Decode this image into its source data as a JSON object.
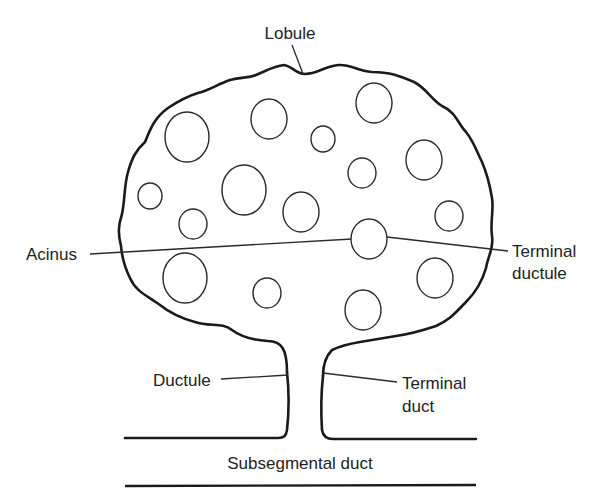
{
  "diagram": {
    "labels": {
      "lobule": "Lobule",
      "acinus": "Acinus",
      "terminal_ductule_line1": "Terminal",
      "terminal_ductule_line2": "ductule",
      "ductule": "Ductule",
      "terminal_duct_line1": "Terminal",
      "terminal_duct_line2": "duct",
      "subsegmental_duct": "Subsegmental duct"
    },
    "colors": {
      "stroke": "#1a1a1a",
      "text": "#222222",
      "background": "#ffffff"
    },
    "acini": [
      {
        "cx": 187,
        "cy": 137,
        "rx": 22,
        "ry": 25
      },
      {
        "cx": 269,
        "cy": 119,
        "rx": 18,
        "ry": 20
      },
      {
        "cx": 374,
        "cy": 103,
        "rx": 18,
        "ry": 20
      },
      {
        "cx": 323,
        "cy": 139,
        "rx": 12,
        "ry": 13
      },
      {
        "cx": 424,
        "cy": 160,
        "rx": 18,
        "ry": 20
      },
      {
        "cx": 362,
        "cy": 173,
        "rx": 14,
        "ry": 15
      },
      {
        "cx": 244,
        "cy": 190,
        "rx": 22,
        "ry": 25
      },
      {
        "cx": 150,
        "cy": 196,
        "rx": 12,
        "ry": 13
      },
      {
        "cx": 301,
        "cy": 212,
        "rx": 18,
        "ry": 20
      },
      {
        "cx": 193,
        "cy": 224,
        "rx": 14,
        "ry": 15
      },
      {
        "cx": 449,
        "cy": 216,
        "rx": 14,
        "ry": 15
      },
      {
        "cx": 369,
        "cy": 239,
        "rx": 18,
        "ry": 20
      },
      {
        "cx": 185,
        "cy": 278,
        "rx": 22,
        "ry": 25
      },
      {
        "cx": 267,
        "cy": 293,
        "rx": 14,
        "ry": 15
      },
      {
        "cx": 435,
        "cy": 278,
        "rx": 18,
        "ry": 20
      },
      {
        "cx": 363,
        "cy": 310,
        "rx": 18,
        "ry": 20
      }
    ]
  }
}
